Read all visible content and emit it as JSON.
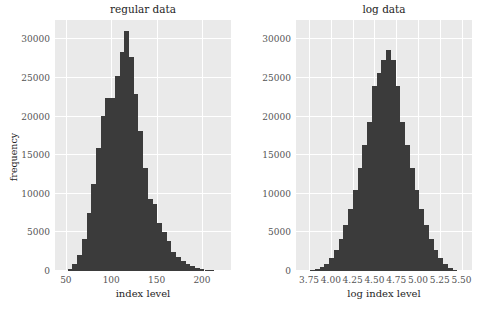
{
  "chart_data": [
    {
      "type": "bar",
      "id": "regular",
      "title": "regular data",
      "xlabel": "index level",
      "ylabel": "frequency",
      "grid": true,
      "legend": "none",
      "xlim": [
        38,
        232
      ],
      "ylim": [
        0,
        32500
      ],
      "xticks": [
        50,
        100,
        150,
        200
      ],
      "xtick_labels": [
        "50",
        "100",
        "150",
        "200"
      ],
      "yticks": [
        0,
        5000,
        10000,
        15000,
        20000,
        25000,
        30000
      ],
      "ytick_labels": [
        "0",
        "5000",
        "10000",
        "15000",
        "20000",
        "25000",
        "30000"
      ],
      "bin_width": 5.2,
      "bin_starts": [
        46.8,
        52.0,
        57.2,
        62.4,
        67.6,
        72.8,
        78.0,
        83.2,
        88.4,
        93.6,
        98.8,
        104.0,
        109.2,
        114.4,
        119.6,
        124.8,
        130.0,
        135.2,
        140.4,
        145.6,
        150.8,
        156.0,
        161.2,
        166.4,
        171.6,
        176.8,
        182.0,
        187.2,
        192.4,
        197.6,
        202.8,
        208.0,
        213.2,
        218.4
      ],
      "values": [
        60,
        300,
        900,
        2100,
        4200,
        7500,
        11300,
        15900,
        20100,
        22400,
        22400,
        25200,
        28300,
        31100,
        27700,
        22900,
        18100,
        13400,
        9300,
        8700,
        6200,
        5100,
        3900,
        2500,
        1800,
        1300,
        900,
        600,
        400,
        250,
        150,
        90,
        50,
        30
      ],
      "color": "#3b3b3b"
    },
    {
      "type": "bar",
      "id": "log",
      "title": "log data",
      "xlabel": "log index level",
      "ylabel": "",
      "grid": true,
      "legend": "none",
      "xlim": [
        3.6,
        5.62
      ],
      "ylim": [
        0,
        32500
      ],
      "xticks": [
        3.75,
        4.0,
        4.25,
        4.5,
        4.75,
        5.0,
        5.25,
        5.5
      ],
      "xtick_labels": [
        "3.75",
        "4.00",
        "4.25",
        "4.50",
        "4.75",
        "5.00",
        "5.25",
        "5.50"
      ],
      "yticks": [
        0,
        5000,
        10000,
        15000,
        20000,
        25000,
        30000
      ],
      "ytick_labels": [
        "0",
        "5000",
        "10000",
        "15000",
        "20000",
        "25000",
        "30000"
      ],
      "bin_width": 0.0545,
      "bin_starts": [
        3.709,
        3.7635,
        3.818,
        3.8725,
        3.927,
        3.9815,
        4.036,
        4.0905,
        4.145,
        4.1995,
        4.254,
        4.3085,
        4.363,
        4.4175,
        4.472,
        4.5265,
        4.581,
        4.6355,
        4.69,
        4.7445,
        4.799,
        4.8535,
        4.908,
        4.9625,
        5.017,
        5.0715,
        5.126,
        5.1805,
        5.235,
        5.2895,
        5.344,
        5.3985
      ],
      "values": [
        40,
        110,
        250,
        520,
        950,
        1650,
        2700,
        4100,
        5900,
        8000,
        10500,
        13400,
        16300,
        19300,
        23900,
        25600,
        27300,
        28600,
        27300,
        23900,
        19300,
        16300,
        13400,
        10500,
        8000,
        5900,
        4100,
        2700,
        1650,
        950,
        450,
        180
      ],
      "color": "#3b3b3b"
    }
  ],
  "figure": {
    "background": "#ffffff",
    "axes_background": "#eaeaea",
    "grid_color": "#ffffff",
    "tick_color": "#555555",
    "label_color": "#262626"
  }
}
